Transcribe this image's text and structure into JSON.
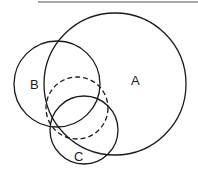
{
  "diagram": {
    "type": "venn",
    "header_rule": {
      "x1": 38,
      "x2": 198,
      "y": 2
    },
    "circles": [
      {
        "id": "A",
        "label": "A",
        "cx": 115,
        "cy": 84,
        "r": 71,
        "style": "solid",
        "label_x": 131,
        "label_y": 85
      },
      {
        "id": "B",
        "label": "B",
        "cx": 57,
        "cy": 84,
        "r": 43,
        "style": "solid",
        "label_x": 30,
        "label_y": 89
      },
      {
        "id": "C",
        "label": "C",
        "cx": 84,
        "cy": 130,
        "r": 34,
        "style": "solid",
        "label_x": 74,
        "label_y": 161
      },
      {
        "id": "D",
        "label": "",
        "cx": 77,
        "cy": 108,
        "r": 31,
        "style": "dashed"
      }
    ],
    "colors": {
      "stroke": "#1a1a1a",
      "background": "#ffffff"
    }
  }
}
